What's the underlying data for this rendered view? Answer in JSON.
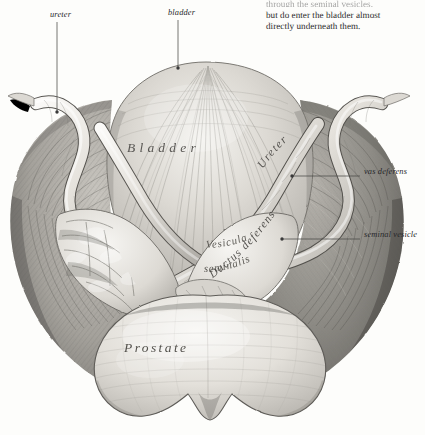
{
  "page": {
    "background": "#fdfdfb",
    "ink": "#3a3a3a",
    "width": 425,
    "height": 435
  },
  "caption": {
    "clipped_line": "through the seminal vesicles,",
    "line1": "but do enter the bladder almost",
    "line2": "directly underneath them."
  },
  "external_labels": {
    "ureter": "ureter",
    "bladder": "bladder",
    "vas_deferens": "vas deferens",
    "seminal_vesicle": "seminal vesicle"
  },
  "figure_labels": {
    "bladder": "Bladder",
    "prostate": "Prostate",
    "ureter_curved": "Ureter",
    "ductus_deferens": "Ductus deferens",
    "vesicula_line1": "Vesicula",
    "vesicula_line2": "seminalis"
  },
  "illustration": {
    "type": "engraving",
    "subject": "posterior view of urinary bladder, seminal vesicles and prostate",
    "style": "antique steel engraving, grayscale hatching",
    "tones": {
      "paper": "#fdfdfb",
      "light_tissue": "#e9e7e2",
      "mid_tissue": "#b9b6b0",
      "dark_tissue": "#7c7a75",
      "deep_shadow": "#55534f",
      "line": "#3a3a3a"
    },
    "parts": [
      "left lateral mass",
      "right lateral mass",
      "bladder dome",
      "left ureter",
      "right ureter",
      "left ductus deferens",
      "right ductus deferens",
      "left seminal vesicle",
      "right seminal vesicle",
      "prostate"
    ]
  }
}
